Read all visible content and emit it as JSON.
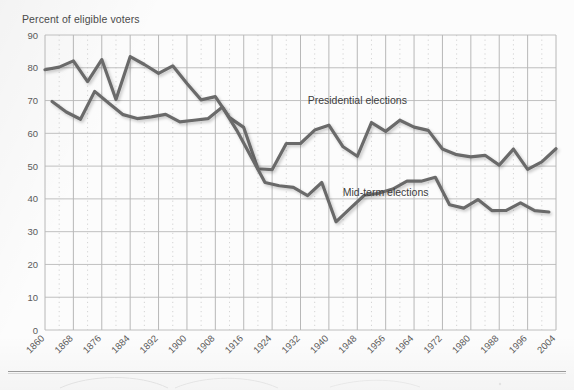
{
  "chart_data": {
    "type": "line",
    "title": "Percent of eligible voters",
    "xlabel": "",
    "ylabel": "Percent of eligible voters",
    "ylim": [
      0,
      90
    ],
    "xlim": [
      1860,
      2004
    ],
    "grid": true,
    "legend_position": "inline-annotation",
    "ytick_labels": [
      "0",
      "10",
      "20",
      "30",
      "40",
      "50",
      "60",
      "70",
      "80",
      "90"
    ],
    "ytick_values": [
      0,
      10,
      20,
      30,
      40,
      50,
      60,
      70,
      80,
      90
    ],
    "xtick_labels": [
      "1860",
      "1868",
      "1876",
      "1884",
      "1892",
      "1900",
      "1908",
      "1916",
      "1924",
      "1932",
      "1940",
      "1948",
      "1956",
      "1964",
      "1972",
      "1980",
      "1988",
      "1996",
      "2004"
    ],
    "xtick_values": [
      1860,
      1868,
      1876,
      1884,
      1892,
      1900,
      1908,
      1916,
      1924,
      1932,
      1940,
      1948,
      1956,
      1964,
      1972,
      1980,
      1988,
      1996,
      2004
    ],
    "minor_xtick_spacing_years": 4,
    "series": [
      {
        "name": "Presidential elections",
        "color": "#6b6b6b",
        "label_x": 1948,
        "label_y": 69,
        "x": [
          1860,
          1864,
          1868,
          1872,
          1876,
          1880,
          1884,
          1888,
          1892,
          1896,
          1900,
          1904,
          1908,
          1912,
          1916,
          1920,
          1924,
          1928,
          1932,
          1936,
          1940,
          1944,
          1948,
          1952,
          1956,
          1960,
          1964,
          1968,
          1972,
          1976,
          1980,
          1984,
          1988,
          1992,
          1996,
          2000,
          2004
        ],
        "values": [
          79.4,
          80.2,
          82.1,
          75.8,
          82.5,
          70.3,
          83.4,
          81.0,
          78.3,
          80.6,
          75.2,
          70.2,
          71.2,
          64.8,
          61.8,
          49.2,
          48.9,
          56.9,
          56.9,
          61.0,
          62.5,
          55.9,
          53.0,
          63.3,
          60.6,
          64.0,
          61.9,
          60.9,
          55.2,
          53.5,
          52.8,
          53.3,
          50.3,
          55.2,
          49.0,
          51.3,
          55.3
        ]
      },
      {
        "name": "Mid-term elections",
        "color": "#6b6b6b",
        "label_x": 1956,
        "label_y": 41,
        "x": [
          1862,
          1866,
          1870,
          1874,
          1878,
          1882,
          1886,
          1890,
          1894,
          1898,
          1902,
          1906,
          1910,
          1914,
          1918,
          1922,
          1926,
          1930,
          1934,
          1938,
          1942,
          1946,
          1950,
          1954,
          1958,
          1962,
          1966,
          1970,
          1974,
          1978,
          1982,
          1986,
          1990,
          1994,
          1998,
          2002
        ],
        "values": [
          69.7,
          66.5,
          64.3,
          72.8,
          69.2,
          65.7,
          64.5,
          65.0,
          65.8,
          63.5,
          64.0,
          64.5,
          68.0,
          61.0,
          53.0,
          45.0,
          44.0,
          43.5,
          41.0,
          45.0,
          33.0,
          37.1,
          41.1,
          41.7,
          43.0,
          45.4,
          45.4,
          46.6,
          38.2,
          37.2,
          39.8,
          36.4,
          36.5,
          38.8,
          36.4,
          36.0
        ]
      }
    ]
  },
  "a11y": {
    "chart_region_name": "voter-turnout-line-chart"
  }
}
